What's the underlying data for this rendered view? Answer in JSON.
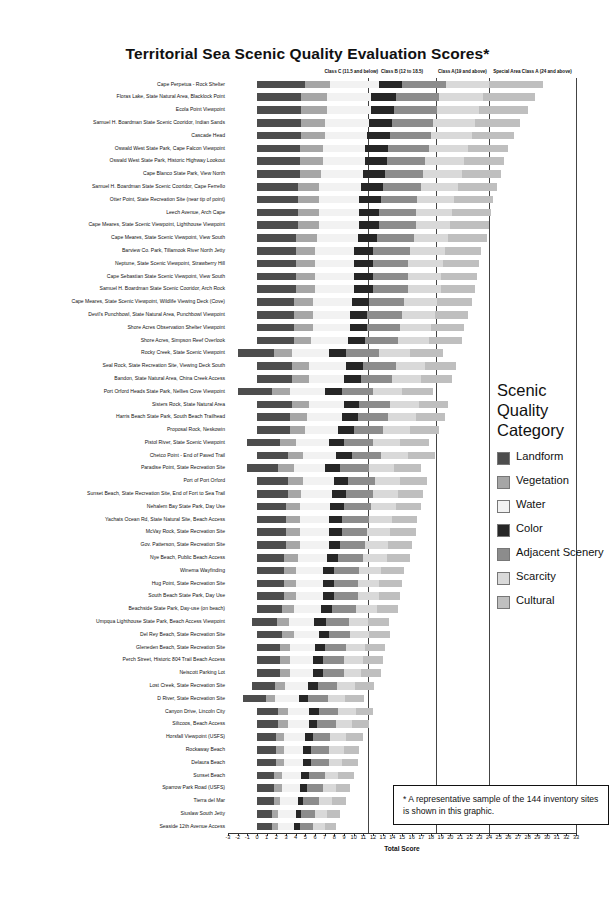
{
  "chart_data": {
    "type": "bar",
    "title": "Territorial Sea Scenic Quality Evaluation Scores*",
    "xlabel": "Total Score",
    "ylabel": "",
    "orientation": "horizontal",
    "stacked": true,
    "xlim": [
      -3,
      33
    ],
    "xticks": [
      "-3",
      "-2",
      "-1",
      "0",
      "1",
      "2",
      "3",
      "4",
      "5",
      "6",
      "7",
      "8",
      "9",
      "10",
      "11",
      "12",
      "13",
      "14",
      "15",
      "16",
      "17",
      "18",
      "19",
      "20",
      "21",
      "22",
      "23",
      "24",
      "25",
      "26",
      "27",
      "28",
      "29",
      "30",
      "31",
      "32",
      "33"
    ],
    "grid": false,
    "class_bands": [
      {
        "label": "Class C (11.5 and below)",
        "x": 11.5
      },
      {
        "label": "Class B (12 to 18.5)",
        "x": 18.5
      },
      {
        "label": "Class A(19 and above)",
        "x": 24
      },
      {
        "label": "Special Area Class A (24 and above)",
        "x": 33
      }
    ],
    "series": [
      {
        "name": "Landform",
        "color": "#4d4d4d"
      },
      {
        "name": "Vegetation",
        "color": "#a6a6a6"
      },
      {
        "name": "Water",
        "color": "#f2f2f2"
      },
      {
        "name": "Color",
        "color": "#262626"
      },
      {
        "name": "Adjacent Scenery",
        "color": "#8c8c8c"
      },
      {
        "name": "Scarcity",
        "color": "#d9d9d9"
      },
      {
        "name": "Cultural",
        "color": "#bfbfbf"
      }
    ],
    "categories": [
      "Cape Perpetua - Rock Shelter",
      "Floras Lake, State Natural Area, Blacklock Point",
      "Ecola Point Viewpoint",
      "Samuel H. Boardman State Scenic Cooridor, Indian Sands",
      "Cascade Head",
      "Oswald West State Park, Cape Falcon Viewpoint",
      "Oswald West State Park, Historic Highway Lookout",
      "Cape Blanco State Park, View North",
      "Samuel H. Boardman State Scenic Cooridor, Cape Ferrello",
      "Otter Point, State Recreation Site (near tip of point)",
      "Leech Avenue, Arch Cape",
      "Cape Meares, State Scenic Viewpoint, Lighthouse Viewpoint",
      "Cape Meares, State Scenic Viewpoint, View South",
      "Barview Co. Park, Tillamook River North Jetty",
      "Neptune, State Scenic Viewpoint, Strawberry Hill",
      "Cape Sebastian State Scenic Viewpoint, View South",
      "Samuel H. Boardman State Scenic Cooridor, Arch Rock",
      "Cape Meares, State Scenic Viewpoint, Wildlife Viewing Deck (Cove)",
      "Devil's Punchbowl, State Natural Area, Punchbowl Viewpoint",
      "Shore Acres Observation Shelter Viewpoint",
      "Shore Acres, Simpson Reef Overlook",
      "Rocky Creek, State Scenic Viewpoint",
      "Seal Rock,  State Recreation Site, Viewing Deck South",
      "Bandon, State Natural Area, China Creek Access",
      "Port Orford Heads State Park, Nellies Cove Viewpoint",
      "Sisters Rock, State Natural Area",
      "Harris Beach State Park, South Beach Trailhead",
      "Proposal Rock, Neskowin",
      "Pistol River, State Scenic Viewpoint",
      "Chetco Point - End of Paved Trail",
      "Paradise Point, State Recreation Site",
      "Port of Port Orford",
      "Sunset Beach, State Recreation Site, End of Fort to Sea Trail",
      "Nehalem Bay State Park, Day Use",
      "Yachats Ocean Rd, State Natural Site, Beach Access",
      "McVay Rock, State Recreation Site",
      "Gov. Patterson, State Recreation Site",
      "Nye Beach, Public Beach Access",
      "Winema Wayfinding",
      "Hug Point, State Recreation Site",
      "South Beach State Park, Day Use",
      "Beachside State Park, Day-use (on beach)",
      "Umpqua Lighthouse State Park, Beach Access Viewpoint",
      "Del Rey Beach, State Recreation Site",
      "Gleneden Beach, State Recreation Site",
      "Perch Street, Historic 804 Trail Beach Access",
      "Neiscott Parking Lot",
      "Lost Creek, State Recreation Site",
      "D River, State Recreation Site",
      "Canyon Drive, Lincoln City",
      "Siltcoos, Beach Access",
      "Horsfall Viewpoint (USFS)",
      "Rockaway Beach",
      "Delaura Beach",
      "Sunset Beach",
      "Sparrow Park Road (USFS)",
      "Tierra del Mar",
      "Siuslaw South Jetty",
      "Seaside 12th Avenue Access"
    ],
    "rows": [
      {
        "start": 0.0,
        "values": [
          5.0,
          2.6,
          5.0,
          2.4,
          4.6,
          4.4,
          5.6
        ]
      },
      {
        "start": 0.0,
        "values": [
          4.6,
          2.6,
          4.6,
          2.6,
          4.4,
          4.6,
          5.4
        ]
      },
      {
        "start": 0.0,
        "values": [
          4.6,
          2.6,
          4.6,
          2.4,
          4.4,
          4.4,
          5.0
        ]
      },
      {
        "start": 0.0,
        "values": [
          4.6,
          2.4,
          4.6,
          2.4,
          4.2,
          4.4,
          4.6
        ]
      },
      {
        "start": 0.0,
        "values": [
          4.6,
          2.4,
          4.4,
          2.4,
          4.2,
          4.2,
          4.4
        ]
      },
      {
        "start": 0.0,
        "values": [
          4.4,
          2.4,
          4.4,
          2.4,
          4.2,
          4.0,
          4.2
        ]
      },
      {
        "start": 0.0,
        "values": [
          4.4,
          2.4,
          4.4,
          2.2,
          4.0,
          4.0,
          4.2
        ]
      },
      {
        "start": 0.0,
        "values": [
          4.4,
          2.2,
          4.4,
          2.2,
          4.0,
          4.0,
          4.0
        ]
      },
      {
        "start": 0.0,
        "values": [
          4.2,
          2.2,
          4.4,
          2.2,
          4.0,
          3.8,
          4.0
        ]
      },
      {
        "start": 0.0,
        "values": [
          4.2,
          2.2,
          4.2,
          2.2,
          3.8,
          3.8,
          4.0
        ]
      },
      {
        "start": 0.0,
        "values": [
          4.2,
          2.2,
          4.2,
          2.0,
          3.8,
          3.8,
          4.0
        ]
      },
      {
        "start": 0.0,
        "values": [
          4.2,
          2.2,
          4.2,
          2.0,
          3.8,
          3.6,
          4.0
        ]
      },
      {
        "start": 0.0,
        "values": [
          4.0,
          2.2,
          4.2,
          2.0,
          3.8,
          3.6,
          4.0
        ]
      },
      {
        "start": 0.0,
        "values": [
          4.0,
          2.0,
          4.0,
          2.0,
          3.8,
          3.6,
          3.8
        ]
      },
      {
        "start": 0.0,
        "values": [
          4.0,
          2.0,
          4.0,
          2.0,
          3.6,
          3.6,
          3.8
        ]
      },
      {
        "start": 0.0,
        "values": [
          4.0,
          2.0,
          4.0,
          2.0,
          3.6,
          3.4,
          3.8
        ]
      },
      {
        "start": 0.0,
        "values": [
          4.0,
          2.0,
          4.0,
          2.0,
          3.6,
          3.4,
          3.6
        ]
      },
      {
        "start": 0.0,
        "values": [
          3.8,
          2.0,
          4.0,
          1.8,
          3.6,
          3.4,
          3.6
        ]
      },
      {
        "start": 0.0,
        "values": [
          3.8,
          2.0,
          3.8,
          1.8,
          3.6,
          3.4,
          3.4
        ]
      },
      {
        "start": 0.0,
        "values": [
          3.8,
          2.0,
          3.8,
          1.8,
          3.4,
          3.2,
          3.4
        ]
      },
      {
        "start": 0.0,
        "values": [
          3.8,
          1.8,
          3.8,
          1.8,
          3.4,
          3.2,
          3.4
        ]
      },
      {
        "start": -2.0,
        "values": [
          3.8,
          1.8,
          3.8,
          1.8,
          3.4,
          3.2,
          3.4
        ]
      },
      {
        "start": 0.0,
        "values": [
          3.6,
          1.8,
          3.8,
          1.8,
          3.4,
          3.0,
          3.2
        ]
      },
      {
        "start": 0.0,
        "values": [
          3.6,
          1.8,
          3.6,
          1.8,
          3.2,
          3.0,
          3.2
        ]
      },
      {
        "start": -2.0,
        "values": [
          3.6,
          1.8,
          3.6,
          1.8,
          3.2,
          3.0,
          3.2
        ]
      },
      {
        "start": 0.0,
        "values": [
          3.6,
          1.8,
          3.6,
          1.6,
          3.2,
          3.0,
          3.0
        ]
      },
      {
        "start": 0.0,
        "values": [
          3.4,
          1.8,
          3.6,
          1.6,
          3.2,
          2.8,
          3.0
        ]
      },
      {
        "start": 0.0,
        "values": [
          3.4,
          1.6,
          3.4,
          1.6,
          3.0,
          2.8,
          3.0
        ]
      },
      {
        "start": -1.0,
        "values": [
          3.4,
          1.6,
          3.4,
          1.6,
          3.0,
          2.8,
          3.0
        ]
      },
      {
        "start": 0.0,
        "values": [
          3.2,
          1.6,
          3.4,
          1.6,
          3.0,
          2.8,
          2.8
        ]
      },
      {
        "start": -1.0,
        "values": [
          3.2,
          1.6,
          3.2,
          1.6,
          3.0,
          2.6,
          2.8
        ]
      },
      {
        "start": 0.0,
        "values": [
          3.2,
          1.6,
          3.2,
          1.4,
          2.8,
          2.6,
          2.8
        ]
      },
      {
        "start": 0.0,
        "values": [
          3.2,
          1.4,
          3.2,
          1.4,
          2.8,
          2.6,
          2.6
        ]
      },
      {
        "start": 0.0,
        "values": [
          3.0,
          1.4,
          3.2,
          1.4,
          2.8,
          2.6,
          2.6
        ]
      },
      {
        "start": 0.0,
        "values": [
          3.0,
          1.4,
          3.0,
          1.4,
          2.8,
          2.4,
          2.6
        ]
      },
      {
        "start": 0.0,
        "values": [
          3.0,
          1.4,
          3.0,
          1.4,
          2.6,
          2.4,
          2.6
        ]
      },
      {
        "start": 0.0,
        "values": [
          3.0,
          1.4,
          3.0,
          1.2,
          2.6,
          2.4,
          2.4
        ]
      },
      {
        "start": 0.0,
        "values": [
          2.8,
          1.4,
          3.0,
          1.2,
          2.6,
          2.4,
          2.4
        ]
      },
      {
        "start": 0.0,
        "values": [
          2.8,
          1.2,
          2.8,
          1.2,
          2.6,
          2.2,
          2.4
        ]
      },
      {
        "start": 0.0,
        "values": [
          2.8,
          1.2,
          2.8,
          1.2,
          2.4,
          2.2,
          2.4
        ]
      },
      {
        "start": 0.0,
        "values": [
          2.8,
          1.2,
          2.8,
          1.2,
          2.4,
          2.2,
          2.2
        ]
      },
      {
        "start": 0.0,
        "values": [
          2.6,
          1.2,
          2.8,
          1.2,
          2.4,
          2.2,
          2.2
        ]
      },
      {
        "start": -0.5,
        "values": [
          2.6,
          1.2,
          2.6,
          1.2,
          2.4,
          2.0,
          2.2
        ]
      },
      {
        "start": 0.0,
        "values": [
          2.6,
          1.2,
          2.6,
          1.0,
          2.2,
          2.0,
          2.2
        ]
      },
      {
        "start": 0.0,
        "values": [
          2.4,
          1.0,
          2.6,
          1.0,
          2.2,
          2.0,
          2.0
        ]
      },
      {
        "start": 0.0,
        "values": [
          2.4,
          1.0,
          2.4,
          1.0,
          2.2,
          2.0,
          2.0
        ]
      },
      {
        "start": 0.0,
        "values": [
          2.4,
          1.0,
          2.4,
          1.0,
          2.2,
          1.8,
          2.0
        ]
      },
      {
        "start": -0.5,
        "values": [
          2.4,
          1.0,
          2.4,
          1.0,
          2.0,
          1.8,
          2.0
        ]
      },
      {
        "start": -1.5,
        "values": [
          2.4,
          1.0,
          2.4,
          1.0,
          2.0,
          1.8,
          2.0
        ]
      },
      {
        "start": 0.0,
        "values": [
          2.2,
          1.0,
          2.2,
          1.0,
          2.0,
          1.8,
          1.8
        ]
      },
      {
        "start": 0.0,
        "values": [
          2.2,
          1.0,
          2.2,
          0.8,
          2.0,
          1.6,
          1.8
        ]
      },
      {
        "start": 0.0,
        "values": [
          2.0,
          0.8,
          2.2,
          0.8,
          1.8,
          1.6,
          1.8
        ]
      },
      {
        "start": 0.0,
        "values": [
          2.0,
          0.8,
          2.0,
          0.8,
          1.8,
          1.6,
          1.6
        ]
      },
      {
        "start": 0.0,
        "values": [
          2.0,
          0.8,
          2.0,
          0.8,
          1.8,
          1.4,
          1.6
        ]
      },
      {
        "start": 0.0,
        "values": [
          1.8,
          0.8,
          2.0,
          0.8,
          1.6,
          1.4,
          1.6
        ]
      },
      {
        "start": 0.0,
        "values": [
          1.8,
          0.8,
          1.8,
          0.8,
          1.6,
          1.4,
          1.4
        ]
      },
      {
        "start": 0.0,
        "values": [
          1.8,
          0.6,
          1.8,
          0.6,
          1.6,
          1.4,
          1.4
        ]
      },
      {
        "start": 0.0,
        "values": [
          1.6,
          0.6,
          1.8,
          0.6,
          1.4,
          1.2,
          1.4
        ]
      },
      {
        "start": 0.0,
        "values": [
          1.6,
          0.6,
          1.6,
          0.6,
          1.4,
          1.2,
          1.2
        ]
      }
    ]
  },
  "legend": {
    "title_line1": "Scenic",
    "title_line2": "Quality",
    "title_line3": "Category",
    "items": [
      {
        "label": "Landform"
      },
      {
        "label": "Vegetation"
      },
      {
        "label": "Water"
      },
      {
        "label": "Color"
      },
      {
        "label": "Adjacent Scenery"
      },
      {
        "label": "Scarcity"
      },
      {
        "label": "Cultural"
      }
    ]
  },
  "note": {
    "text": "* A representative sample of the 144 inventory sites is shown  in this graphic."
  }
}
